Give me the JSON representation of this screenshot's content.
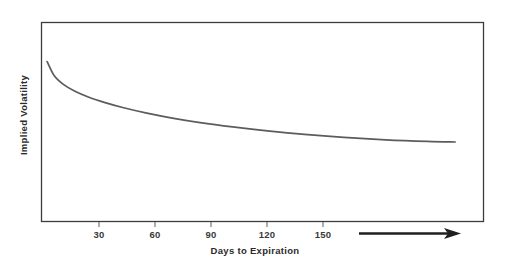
{
  "chart_data": {
    "type": "line",
    "title": "",
    "xlabel": "Days to Expiration",
    "ylabel": "Implied Volatility",
    "xlim": [
      0,
      190
    ],
    "ylim": [
      0,
      1
    ],
    "grid": false,
    "legend": null,
    "xticks": [
      30,
      60,
      90,
      120,
      150
    ],
    "xtick_labels": [
      "30",
      "60",
      "90",
      "120",
      "150"
    ],
    "yticks": [],
    "ytick_labels": [],
    "series": [
      {
        "name": "Implied Volatility term structure",
        "color": "#5c5c5c",
        "linewidth": 1.7,
        "x": [
          2,
          5,
          9,
          14,
          20,
          27,
          35,
          45,
          56,
          68,
          82,
          97,
          113,
          130,
          148,
          166,
          178
        ],
        "y": [
          0.805,
          0.735,
          0.69,
          0.655,
          0.625,
          0.598,
          0.572,
          0.545,
          0.52,
          0.497,
          0.475,
          0.455,
          0.437,
          0.422,
          0.41,
          0.402,
          0.399
        ]
      }
    ],
    "annotations": [
      {
        "name": "time-direction-arrow",
        "type": "arrow",
        "label": "",
        "x_start": 158,
        "x_end": 190,
        "y": -0.06
      }
    ]
  },
  "style": {
    "frame_color": "#3c3c3c",
    "curve_color": "#5c5c5c",
    "text_color": "#2b2b2b",
    "tick_color": "#3a3a3a",
    "background": "#ffffff",
    "arrow_color": "#1f1f1f"
  }
}
